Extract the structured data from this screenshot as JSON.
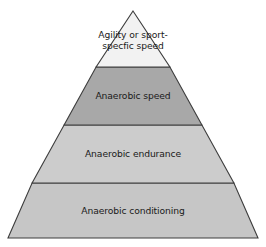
{
  "diagram": {
    "type": "pyramid",
    "shape_name": "training-pyramid",
    "background_color": "#ffffff",
    "outline_color": "#3d3d3d",
    "apex": {
      "x": 133,
      "y": 11
    },
    "base_left": {
      "x": 8,
      "y": 238
    },
    "base_right": {
      "x": 258,
      "y": 238
    },
    "divider_y": [
      67,
      125,
      183
    ],
    "tiers": [
      {
        "level": 1,
        "position": "top",
        "label": "Agility or sport-\nspecfic speed",
        "label_line_1": "Agility or sport-",
        "label_line_2": "specfic speed",
        "fill_color": "#f2f2f2",
        "text_color": "#1a1a1a"
      },
      {
        "level": 2,
        "position": "upper-middle",
        "label": "Anaerobic speed",
        "fill_color": "#a8a8a8",
        "text_color": "#1a1a1a"
      },
      {
        "level": 3,
        "position": "lower-middle",
        "label": "Anaerobic endurance",
        "fill_color": "#cccccc",
        "text_color": "#1a1a1a"
      },
      {
        "level": 4,
        "position": "base",
        "label": "Anaerobic conditioning",
        "fill_color": "#c6c6c6",
        "text_color": "#1a1a1a"
      }
    ]
  }
}
